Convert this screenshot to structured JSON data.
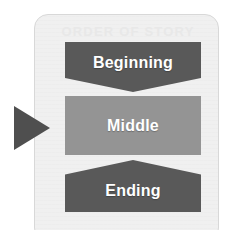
{
  "diagram": {
    "card": {
      "background_color": "#f0f0f0",
      "border_color": "#d8d8d8"
    },
    "ghost_heading": "ORDER OF STORY",
    "ghost_bottom": "",
    "pointer": {
      "icon": "right-triangle-pointer-icon",
      "color": "#4f4f4f",
      "points_to": "Middle"
    },
    "stages": [
      {
        "label": "Beginning",
        "shape": "chevron-down-banner",
        "color": "#595959",
        "text_color": "#ffffff"
      },
      {
        "label": "Middle",
        "shape": "rectangle",
        "color": "#949494",
        "text_color": "#ffffff"
      },
      {
        "label": "Ending",
        "shape": "chevron-up-banner",
        "color": "#595959",
        "text_color": "#ffffff"
      }
    ]
  }
}
